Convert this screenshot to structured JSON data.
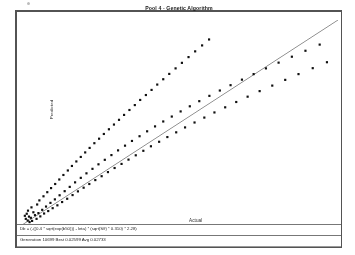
{
  "window": {
    "title": "Pool 4 - Genetic Algorithm"
  },
  "axes": {
    "y_label": "Predicted",
    "x_label": "Actual"
  },
  "readout": {
    "formula": "Db = (-((0.4 * sqrt(exp(b50))) - leta) * (sqrt(S/f) * 0.310) * 2.28)",
    "status": "Generation 10699  Best 0.02599  Avg 0.02733"
  },
  "chart_data": {
    "type": "scatter",
    "title": "Pool 4 - Genetic Algorithm",
    "xlabel": "Actual",
    "ylabel": "Predicted",
    "xlim": [
      0,
      1
    ],
    "ylim": [
      0,
      1
    ],
    "grid": false,
    "legend": null,
    "reference_line": {
      "name": "1:1 identity line",
      "x": [
        0.0,
        1.0
      ],
      "y": [
        0.0,
        1.0
      ],
      "color": "#5a5a5a"
    },
    "marker_color": "#151515",
    "series": [
      {
        "name": "Predicted vs Actual",
        "points": [
          [
            0.012,
            0.03
          ],
          [
            0.018,
            0.022
          ],
          [
            0.022,
            0.041
          ],
          [
            0.015,
            0.055
          ],
          [
            0.028,
            0.035
          ],
          [
            0.032,
            0.02
          ],
          [
            0.009,
            0.045
          ],
          [
            0.036,
            0.062
          ],
          [
            0.024,
            0.014
          ],
          [
            0.041,
            0.048
          ],
          [
            0.046,
            0.03
          ],
          [
            0.019,
            0.07
          ],
          [
            0.052,
            0.058
          ],
          [
            0.03,
            0.086
          ],
          [
            0.058,
            0.042
          ],
          [
            0.064,
            0.074
          ],
          [
            0.048,
            0.1
          ],
          [
            0.07,
            0.056
          ],
          [
            0.076,
            0.09
          ],
          [
            0.055,
            0.12
          ],
          [
            0.083,
            0.068
          ],
          [
            0.09,
            0.108
          ],
          [
            0.068,
            0.14
          ],
          [
            0.097,
            0.082
          ],
          [
            0.104,
            0.125
          ],
          [
            0.08,
            0.16
          ],
          [
            0.112,
            0.096
          ],
          [
            0.119,
            0.145
          ],
          [
            0.092,
            0.18
          ],
          [
            0.127,
            0.112
          ],
          [
            0.135,
            0.165
          ],
          [
            0.105,
            0.2
          ],
          [
            0.143,
            0.128
          ],
          [
            0.151,
            0.186
          ],
          [
            0.118,
            0.222
          ],
          [
            0.16,
            0.146
          ],
          [
            0.168,
            0.208
          ],
          [
            0.131,
            0.244
          ],
          [
            0.177,
            0.164
          ],
          [
            0.186,
            0.23
          ],
          [
            0.145,
            0.266
          ],
          [
            0.195,
            0.182
          ],
          [
            0.204,
            0.252
          ],
          [
            0.158,
            0.288
          ],
          [
            0.213,
            0.2
          ],
          [
            0.223,
            0.274
          ],
          [
            0.172,
            0.31
          ],
          [
            0.232,
            0.219
          ],
          [
            0.242,
            0.296
          ],
          [
            0.186,
            0.332
          ],
          [
            0.252,
            0.238
          ],
          [
            0.262,
            0.318
          ],
          [
            0.2,
            0.354
          ],
          [
            0.272,
            0.258
          ],
          [
            0.283,
            0.341
          ],
          [
            0.214,
            0.376
          ],
          [
            0.293,
            0.278
          ],
          [
            0.304,
            0.364
          ],
          [
            0.229,
            0.399
          ],
          [
            0.315,
            0.298
          ],
          [
            0.326,
            0.387
          ],
          [
            0.244,
            0.421
          ],
          [
            0.337,
            0.319
          ],
          [
            0.348,
            0.41
          ],
          [
            0.259,
            0.444
          ],
          [
            0.36,
            0.34
          ],
          [
            0.372,
            0.433
          ],
          [
            0.275,
            0.467
          ],
          [
            0.384,
            0.362
          ],
          [
            0.396,
            0.457
          ],
          [
            0.291,
            0.49
          ],
          [
            0.408,
            0.384
          ],
          [
            0.421,
            0.481
          ],
          [
            0.307,
            0.513
          ],
          [
            0.434,
            0.406
          ],
          [
            0.447,
            0.505
          ],
          [
            0.323,
            0.537
          ],
          [
            0.46,
            0.429
          ],
          [
            0.474,
            0.529
          ],
          [
            0.34,
            0.561
          ],
          [
            0.488,
            0.452
          ],
          [
            0.502,
            0.554
          ],
          [
            0.357,
            0.585
          ],
          [
            0.516,
            0.476
          ],
          [
            0.531,
            0.579
          ],
          [
            0.374,
            0.61
          ],
          [
            0.546,
            0.5
          ],
          [
            0.561,
            0.604
          ],
          [
            0.392,
            0.634
          ],
          [
            0.577,
            0.524
          ],
          [
            0.593,
            0.63
          ],
          [
            0.41,
            0.659
          ],
          [
            0.609,
            0.549
          ],
          [
            0.626,
            0.656
          ],
          [
            0.428,
            0.685
          ],
          [
            0.643,
            0.574
          ],
          [
            0.66,
            0.682
          ],
          [
            0.447,
            0.711
          ],
          [
            0.678,
            0.6
          ],
          [
            0.696,
            0.709
          ],
          [
            0.466,
            0.737
          ],
          [
            0.714,
            0.626
          ],
          [
            0.733,
            0.736
          ],
          [
            0.486,
            0.764
          ],
          [
            0.752,
            0.653
          ],
          [
            0.772,
            0.764
          ],
          [
            0.506,
            0.791
          ],
          [
            0.792,
            0.68
          ],
          [
            0.812,
            0.792
          ],
          [
            0.527,
            0.819
          ],
          [
            0.833,
            0.708
          ],
          [
            0.854,
            0.821
          ],
          [
            0.548,
            0.847
          ],
          [
            0.875,
            0.736
          ],
          [
            0.897,
            0.85
          ],
          [
            0.57,
            0.876
          ],
          [
            0.92,
            0.765
          ],
          [
            0.942,
            0.88
          ],
          [
            0.592,
            0.905
          ],
          [
            0.965,
            0.794
          ]
        ]
      }
    ]
  }
}
